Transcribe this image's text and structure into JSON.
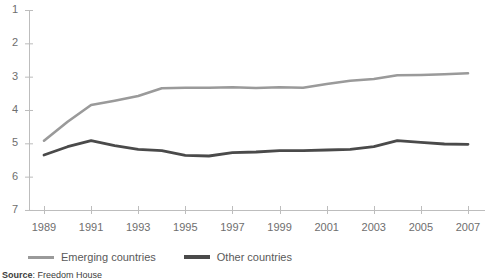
{
  "chart_data": {
    "type": "line",
    "title": "",
    "xlabel": "",
    "ylabel": "",
    "x": [
      1989,
      1990,
      1991,
      1992,
      1993,
      1994,
      1995,
      1996,
      1997,
      1998,
      1999,
      2000,
      2001,
      2002,
      2003,
      2004,
      2005,
      2006,
      2007
    ],
    "xlim": [
      1989,
      2007
    ],
    "ylim": [
      7,
      1
    ],
    "y_axis_inverted": true,
    "y_ticks": [
      1,
      2,
      3,
      4,
      5,
      6,
      7
    ],
    "x_ticks": [
      1989,
      1991,
      1993,
      1995,
      1997,
      1999,
      2001,
      2003,
      2005,
      2007
    ],
    "x_tick_labels": [
      "1989",
      "1991",
      "1993",
      "1995",
      "1997",
      "1999",
      "2001",
      "2003",
      "2005",
      "2007"
    ],
    "y_tick_labels": [
      "1",
      "2",
      "3",
      "4",
      "5",
      "6",
      "7"
    ],
    "grid": false,
    "legend_position": "bottom-left",
    "series": [
      {
        "name": "Emerging countries",
        "color": "#9a9a9a",
        "line_width": 2.6,
        "values": [
          4.92,
          4.35,
          3.85,
          3.72,
          3.58,
          3.35,
          3.33,
          3.33,
          3.32,
          3.34,
          3.32,
          3.33,
          3.22,
          3.12,
          3.07,
          2.96,
          2.95,
          2.93,
          2.9
        ]
      },
      {
        "name": "Other countries",
        "color": "#4a4a4a",
        "line_width": 2.8,
        "values": [
          5.35,
          5.1,
          4.92,
          5.07,
          5.18,
          5.22,
          5.36,
          5.38,
          5.28,
          5.26,
          5.22,
          5.22,
          5.2,
          5.18,
          5.1,
          4.92,
          4.97,
          5.02,
          5.03
        ]
      }
    ]
  },
  "legend": {
    "items": [
      {
        "label": "Emerging countries",
        "color": "#9a9a9a"
      },
      {
        "label": "Other countries",
        "color": "#4a4a4a"
      }
    ]
  },
  "source": {
    "label": "Source",
    "separator": ":",
    "text": "Freedom House"
  }
}
